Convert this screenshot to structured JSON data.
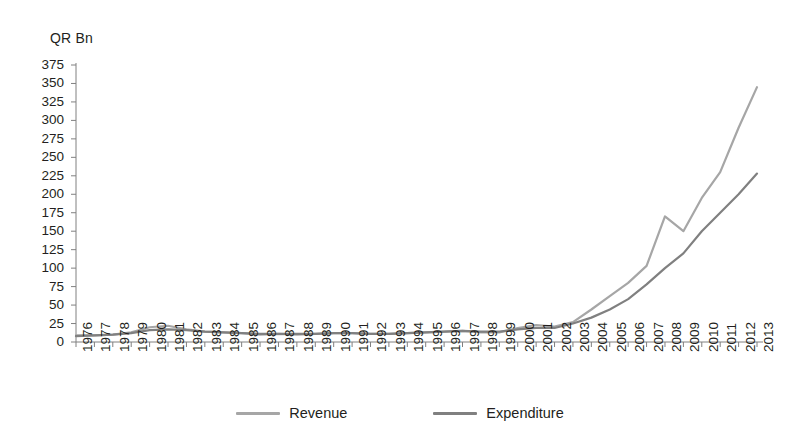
{
  "axis": {
    "unit_label": "QR Bn",
    "y_ticks": [
      0,
      25,
      50,
      75,
      100,
      125,
      150,
      175,
      200,
      225,
      250,
      275,
      300,
      325,
      350,
      375
    ],
    "x_ticks": [
      "1976",
      "1977",
      "1978",
      "1979",
      "1980",
      "1981",
      "1982",
      "1983",
      "1984",
      "1985",
      "1986",
      "1987",
      "1988",
      "1989",
      "1990",
      "1991",
      "1992",
      "1993",
      "1994",
      "1995",
      "1996",
      "1997",
      "1998",
      "1999",
      "2000",
      "2001",
      "2002",
      "2003",
      "2004",
      "2005",
      "2006",
      "2007",
      "2008",
      "2009",
      "2010",
      "2011",
      "2012",
      "2013"
    ]
  },
  "legend": {
    "items": [
      {
        "label": "Revenue",
        "color": "#a6a6a6"
      },
      {
        "label": "Expenditure",
        "color": "#808080"
      }
    ]
  },
  "colors": {
    "revenue": "#a6a6a6",
    "expenditure": "#808080",
    "axis": "#808080",
    "text": "#231f20",
    "background": "#ffffff"
  },
  "chart_data": {
    "type": "line",
    "title": "",
    "subtitle": "",
    "xlabel": "",
    "ylabel": "QR Bn",
    "ylim": [
      0,
      375
    ],
    "ytick_step": 25,
    "grid": false,
    "legend_position": "bottom",
    "categories": [
      "1976",
      "1977",
      "1978",
      "1979",
      "1980",
      "1981",
      "1982",
      "1983",
      "1984",
      "1985",
      "1986",
      "1987",
      "1988",
      "1989",
      "1990",
      "1991",
      "1992",
      "1993",
      "1994",
      "1995",
      "1996",
      "1997",
      "1998",
      "1999",
      "2000",
      "2001",
      "2002",
      "2003",
      "2004",
      "2005",
      "2006",
      "2007",
      "2008",
      "2009",
      "2010",
      "2011",
      "2012",
      "2013"
    ],
    "series": [
      {
        "name": "Revenue",
        "color": "#a6a6a6",
        "values": [
          9,
          9,
          10,
          13,
          20,
          22,
          17,
          14,
          13,
          12,
          10,
          11,
          10,
          11,
          12,
          12,
          11,
          11,
          12,
          13,
          14,
          15,
          13,
          13,
          19,
          23,
          21,
          27,
          44,
          62,
          80,
          103,
          170,
          150,
          195,
          230,
          290,
          345
        ]
      },
      {
        "name": "Expenditure",
        "color": "#808080",
        "values": [
          8,
          9,
          10,
          12,
          16,
          17,
          16,
          14,
          13,
          12,
          11,
          11,
          11,
          11,
          12,
          12,
          11,
          11,
          12,
          13,
          14,
          15,
          14,
          14,
          17,
          19,
          19,
          25,
          33,
          44,
          58,
          78,
          100,
          120,
          150,
          175,
          200,
          228
        ]
      }
    ]
  }
}
